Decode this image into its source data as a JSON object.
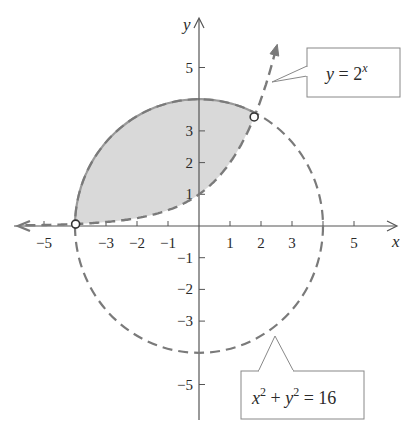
{
  "figure": {
    "axes": {
      "x_label": "x",
      "y_label": "y",
      "x_ticks": [
        {
          "value": -5,
          "label": "−5"
        },
        {
          "value": -3,
          "label": "−3"
        },
        {
          "value": -2,
          "label": "−2"
        },
        {
          "value": -1,
          "label": "−1"
        },
        {
          "value": 1,
          "label": "1"
        },
        {
          "value": 2,
          "label": "2"
        },
        {
          "value": 3,
          "label": "3"
        },
        {
          "value": 5,
          "label": "5"
        }
      ],
      "y_ticks": [
        {
          "value": 5,
          "label": "5"
        },
        {
          "value": 3,
          "label": "3"
        },
        {
          "value": 2,
          "label": "2"
        },
        {
          "value": 1,
          "label": "1"
        },
        {
          "value": -1,
          "label": "−1"
        },
        {
          "value": -2,
          "label": "−2"
        },
        {
          "value": -3,
          "label": "−3"
        },
        {
          "value": -5,
          "label": "−5"
        }
      ]
    },
    "curves": {
      "exponential": {
        "equation_lhs": "y",
        "equation_eq": " = 2",
        "equation_sup": "x",
        "style": "dashed",
        "color": "#7a7a7a"
      },
      "circle": {
        "equation_x": "x",
        "equation_sup1": "2",
        "equation_plus": " + ",
        "equation_y": "y",
        "equation_sup2": "2",
        "equation_rhs": " = 16",
        "radius": 4,
        "style": "dashed",
        "color": "#7a7a7a"
      }
    },
    "intersections": [
      {
        "x": -3.98,
        "y": 0.06
      },
      {
        "x": 1.78,
        "y": 3.44
      }
    ],
    "shaded_region": {
      "fill_color": "#d9d9d9",
      "boundary_color": "#9a9a9a"
    },
    "colors": {
      "axis": "#555555",
      "text": "#2a2a2a",
      "curve": "#7a7a7a",
      "box_border": "#888888"
    }
  }
}
